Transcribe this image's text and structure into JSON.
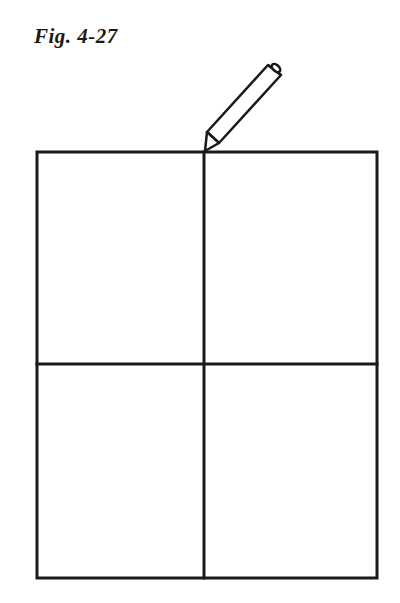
{
  "figure": {
    "caption": "Fig. 4-27",
    "colors": {
      "ink": "#1a1a1a",
      "background": "#ffffff"
    },
    "elements": {
      "outer_rectangle": {
        "x1": 37,
        "y1": 152,
        "x2": 377,
        "y2": 578
      },
      "vertical_divider": {
        "x": 204,
        "y1": 152,
        "y2": 578
      },
      "horizontal_divider": {
        "y": 364,
        "x1": 37,
        "x2": 377
      },
      "pencil": {
        "tip": [
          205,
          150
        ],
        "end": [
          276,
          70
        ]
      }
    }
  }
}
